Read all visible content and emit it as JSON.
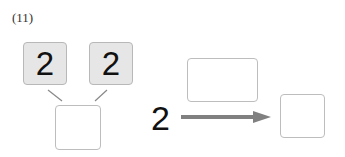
{
  "problem": {
    "label": "(11)",
    "decomposition": {
      "top_left": "2",
      "top_right": "2",
      "bottom": ""
    },
    "arrow_diagram": {
      "start": "2",
      "operation": "",
      "result": ""
    },
    "colors": {
      "filled_box": "#e6e6e6",
      "box_border": "#bdbdbd",
      "arrow": "#808080"
    }
  }
}
